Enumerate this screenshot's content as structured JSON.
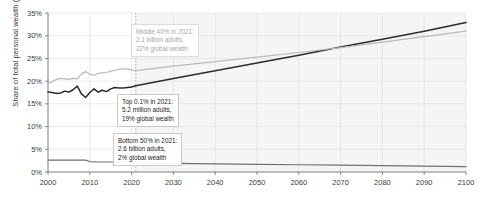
{
  "chart_data": {
    "type": "line",
    "title": "",
    "xlabel": "",
    "ylabel": "Share of total personal wealth (%)",
    "xlim": [
      2000,
      2100
    ],
    "ylim": [
      0,
      35
    ],
    "grid": true,
    "legend": "annotations",
    "forecast_start": 2021,
    "xticks": [
      "2000",
      "2010",
      "2020",
      "2030",
      "2040",
      "2050",
      "2060",
      "2070",
      "2080",
      "2090",
      "2100"
    ],
    "yticks": [
      "0%",
      "5%",
      "10%",
      "15%",
      "20%",
      "25%",
      "30%",
      "35%"
    ],
    "series": [
      {
        "name": "Top 0.1%",
        "color": "#2b2b2b",
        "points": [
          [
            2000,
            17.6
          ],
          [
            2001,
            17.5
          ],
          [
            2002,
            17.3
          ],
          [
            2003,
            17.4
          ],
          [
            2004,
            17.8
          ],
          [
            2005,
            17.6
          ],
          [
            2006,
            18.1
          ],
          [
            2007,
            18.9
          ],
          [
            2008,
            17.2
          ],
          [
            2009,
            16.4
          ],
          [
            2010,
            17.5
          ],
          [
            2011,
            18.3
          ],
          [
            2012,
            17.6
          ],
          [
            2013,
            18.0
          ],
          [
            2014,
            17.7
          ],
          [
            2015,
            18.3
          ],
          [
            2016,
            18.6
          ],
          [
            2017,
            18.5
          ],
          [
            2018,
            18.5
          ],
          [
            2019,
            18.6
          ],
          [
            2020,
            18.7
          ],
          [
            2021,
            19.0
          ],
          [
            2030,
            20.6
          ],
          [
            2040,
            22.3
          ],
          [
            2050,
            24.0
          ],
          [
            2060,
            25.7
          ],
          [
            2070,
            27.5
          ],
          [
            2080,
            29.2
          ],
          [
            2090,
            31.0
          ],
          [
            2100,
            32.9
          ]
        ]
      },
      {
        "name": "Middle 40%",
        "color": "#b9b9b9",
        "points": [
          [
            2000,
            19.5
          ],
          [
            2001,
            19.9
          ],
          [
            2002,
            20.4
          ],
          [
            2003,
            20.6
          ],
          [
            2004,
            20.5
          ],
          [
            2005,
            20.4
          ],
          [
            2006,
            20.6
          ],
          [
            2007,
            20.5
          ],
          [
            2008,
            21.6
          ],
          [
            2009,
            22.1
          ],
          [
            2010,
            21.5
          ],
          [
            2011,
            21.3
          ],
          [
            2012,
            21.7
          ],
          [
            2013,
            21.8
          ],
          [
            2014,
            21.9
          ],
          [
            2015,
            22.2
          ],
          [
            2016,
            22.4
          ],
          [
            2017,
            22.6
          ],
          [
            2018,
            22.7
          ],
          [
            2019,
            22.7
          ],
          [
            2020,
            22.5
          ],
          [
            2021,
            22.3
          ],
          [
            2030,
            23.3
          ],
          [
            2040,
            24.3
          ],
          [
            2050,
            25.3
          ],
          [
            2060,
            26.3
          ],
          [
            2070,
            27.4
          ],
          [
            2080,
            28.6
          ],
          [
            2090,
            29.8
          ],
          [
            2100,
            31.0
          ]
        ]
      },
      {
        "name": "Bottom 50%",
        "color": "#6e6e6e",
        "points": [
          [
            2000,
            2.6
          ],
          [
            2005,
            2.6
          ],
          [
            2008,
            2.6
          ],
          [
            2009,
            2.6
          ],
          [
            2010,
            2.3
          ],
          [
            2012,
            2.2
          ],
          [
            2015,
            2.2
          ],
          [
            2018,
            2.2
          ],
          [
            2021,
            2.1
          ],
          [
            2030,
            1.9
          ],
          [
            2040,
            1.8
          ],
          [
            2050,
            1.7
          ],
          [
            2060,
            1.6
          ],
          [
            2070,
            1.5
          ],
          [
            2080,
            1.4
          ],
          [
            2090,
            1.3
          ],
          [
            2100,
            1.2
          ]
        ]
      }
    ],
    "annotations": [
      {
        "id": "middle40",
        "lines": [
          "Middle 40% in 2021:",
          "2.1 billion adults,",
          "22% global wealth"
        ],
        "style": "muted"
      },
      {
        "id": "top01",
        "lines": [
          "Top 0.1% in 2021:",
          "5.2 million adults,",
          "19% global wealth"
        ],
        "style": "normal"
      },
      {
        "id": "bottom50",
        "lines": [
          "Bottom 50% in 2021:",
          "2.6 billion adults,",
          "2% global wealth"
        ],
        "style": "normal"
      }
    ]
  }
}
